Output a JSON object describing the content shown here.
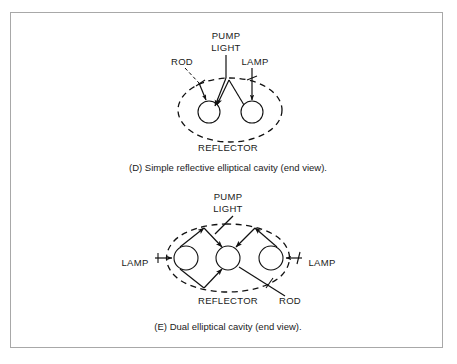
{
  "figure": {
    "background_color": "#ffffff",
    "frame_color": "#a8a8a8",
    "ink_color": "#111111"
  },
  "panels": [
    {
      "id": "D",
      "caption": "(D) Simple reflective elliptical cavity (end view).",
      "labels": {
        "rod": "ROD",
        "pump": "PUMP",
        "light": "LIGHT",
        "lamp": "LAMP",
        "reflector": "REFLECTOR"
      }
    },
    {
      "id": "E",
      "caption": "(E) Dual elliptical cavity (end view).",
      "labels": {
        "pump": "PUMP",
        "light": "LIGHT",
        "lamp_left": "LAMP",
        "lamp_right": "LAMP",
        "reflector": "REFLECTOR",
        "rod": "ROD"
      }
    }
  ]
}
